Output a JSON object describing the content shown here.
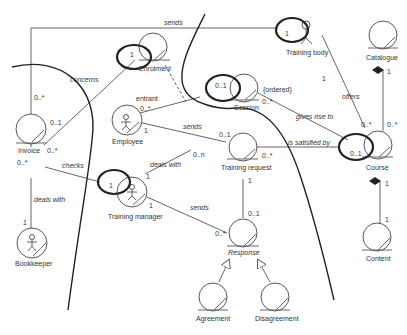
{
  "diagram": {
    "type": "UML robustness / entity class diagram",
    "entities": [
      {
        "id": "invoice",
        "label": "Invoice",
        "kind": "entity"
      },
      {
        "id": "enrolment",
        "label": "Enrolment",
        "kind": "entity"
      },
      {
        "id": "training_body",
        "label": "Training body",
        "kind": "actor-control"
      },
      {
        "id": "catalogue",
        "label": "Catalogue",
        "kind": "entity"
      },
      {
        "id": "employee",
        "label": "Employee",
        "kind": "actor-entity"
      },
      {
        "id": "session",
        "label": "Session",
        "kind": "entity"
      },
      {
        "id": "training_request",
        "label": "Training request",
        "kind": "entity"
      },
      {
        "id": "course",
        "label": "Course",
        "kind": "entity"
      },
      {
        "id": "training_manager",
        "label": "Training manager",
        "kind": "actor-entity"
      },
      {
        "id": "bookkeeper",
        "label": "Bookkeeper",
        "kind": "actor-entity"
      },
      {
        "id": "response",
        "label": "Response",
        "kind": "entity",
        "italic": true
      },
      {
        "id": "agreement",
        "label": "Agreement",
        "kind": "entity"
      },
      {
        "id": "disagreement",
        "label": "Disagreement",
        "kind": "entity"
      },
      {
        "id": "content",
        "label": "Content",
        "kind": "entity"
      }
    ],
    "associations": {
      "sends_top": {
        "label": "sends",
        "from": "Invoice",
        "to": "Training body",
        "from_mult": "0..*",
        "to_mult": "1"
      },
      "concerns": {
        "label": "concerns",
        "from": "Invoice",
        "to": "Enrolment",
        "from_mult": "0..1",
        "to_mult": "1"
      },
      "checks": {
        "label": "checks",
        "from": "Invoice",
        "to": "Training manager",
        "from_mult": "0..*",
        "to_mult": "1"
      },
      "deals_with_bk": {
        "label": "deals with",
        "from": "Invoice",
        "to": "Bookkeeper",
        "from_mult": "0..*",
        "to_mult": "1"
      },
      "entrant": {
        "label": "entrant",
        "from": "Employee",
        "to": "Session",
        "from_mult": "0..*",
        "to_mult": "0..1"
      },
      "sends_emp": {
        "label": "sends",
        "from": "Employee",
        "to": "Training request",
        "from_mult": "1",
        "to_mult": "0..1"
      },
      "ordered": {
        "label": "{ordered}",
        "from": "Session",
        "to": "Course",
        "from_mult": "0..*"
      },
      "gives_rise_to": {
        "label": "gives rise to",
        "from": "Session",
        "to": "Course"
      },
      "offers": {
        "label": "offers",
        "from": "Training body",
        "to": "Course",
        "from_mult": "1",
        "to_mult": "0..*"
      },
      "is_satisfied_by": {
        "label": "is satisfied by",
        "from": "Training request",
        "to": "Course",
        "from_mult": "0..*",
        "to_mult": "0..1"
      },
      "deals_with_tm": {
        "label": "deals with",
        "from": "Training manager",
        "to": "Training request",
        "from_mult": "1",
        "to_mult": "0..n"
      },
      "sends_tm": {
        "label": "sends",
        "from": "Training manager",
        "to": "Response",
        "from_mult": "1",
        "to_mult": "0..*"
      },
      "tr_response": {
        "from": "Training request",
        "to": "Response",
        "from_mult": "1",
        "to_mult": "0..1"
      },
      "catalogue_course": {
        "from": "Catalogue",
        "to": "Course",
        "from_mult": "1",
        "to_mult": "0..*"
      },
      "course_content": {
        "from": "Course",
        "to": "Content",
        "from_mult": "1",
        "to_mult": "1"
      }
    },
    "mult": {
      "zero_star": "0..*",
      "zero_one": "0..1",
      "zero_n": "0..n",
      "one": "1",
      "zero_one_sp": "0..1"
    }
  }
}
